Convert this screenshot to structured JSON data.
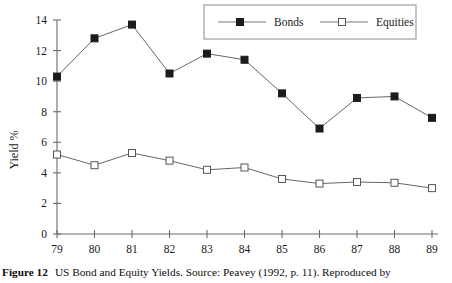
{
  "figure": {
    "caption_label": "Figure 12",
    "caption_text": "US Bond and Equity Yields. Source: Peavey (1992, p. 11). Reproduced by"
  },
  "chart_data": {
    "type": "line",
    "title": "",
    "xlabel": "",
    "ylabel": "Yield %",
    "categories": [
      "79",
      "80",
      "81",
      "82",
      "83",
      "84",
      "85",
      "86",
      "87",
      "88",
      "89"
    ],
    "x_tick_labels": [
      "79",
      "80",
      "81",
      "82",
      "83",
      "84",
      "85",
      "86",
      "87",
      "88",
      "89"
    ],
    "y_tick_labels": [
      "0",
      "2",
      "4",
      "6",
      "8",
      "10",
      "12",
      "14"
    ],
    "y_ticks": [
      0,
      2,
      4,
      6,
      8,
      10,
      12,
      14
    ],
    "ylim": [
      0,
      14
    ],
    "grid": false,
    "legend_position": "top-right",
    "series": [
      {
        "name": "Bonds",
        "marker": "filled-square",
        "color": "#1c1c1c",
        "values": [
          10.3,
          12.8,
          13.7,
          10.5,
          11.8,
          11.4,
          9.2,
          6.9,
          8.9,
          9.0,
          7.6
        ]
      },
      {
        "name": "Equities",
        "marker": "open-square",
        "color": "#555555",
        "values": [
          5.2,
          4.5,
          5.3,
          4.8,
          4.2,
          4.35,
          3.6,
          3.3,
          3.4,
          3.35,
          3.0
        ]
      }
    ]
  },
  "legend": {
    "items": [
      {
        "label": "Bonds",
        "marker": "filled-square"
      },
      {
        "label": "Equities",
        "marker": "open-square"
      }
    ]
  }
}
